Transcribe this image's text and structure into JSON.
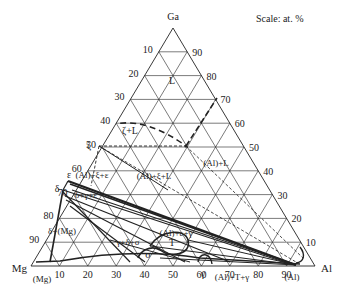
{
  "diagram": {
    "type": "ternary-phase-diagram",
    "vertices": {
      "top": {
        "label": "Ga",
        "x": 173,
        "y": 28
      },
      "left": {
        "label": "Mg",
        "x": 31,
        "y": 266
      },
      "right": {
        "label": "Al",
        "x": 315,
        "y": 266
      }
    },
    "scale_label": "Scale: at. %",
    "left_axis_ticks": [
      "10",
      "20",
      "30",
      "40",
      "50",
      "60",
      "70",
      "80",
      "90"
    ],
    "right_axis_ticks": [
      "90",
      "80",
      "70",
      "60",
      "50",
      "40",
      "30",
      "20",
      "10"
    ],
    "bottom_axis_ticks": [
      "10",
      "20",
      "30",
      "40",
      "50",
      "60",
      "70",
      "80",
      "90"
    ],
    "phase_labels": [
      {
        "text": "L",
        "x": 172,
        "y": 84
      },
      {
        "text": "ζ+L",
        "x": 130,
        "y": 134
      },
      {
        "text": "(Al)+L",
        "x": 216,
        "y": 166
      },
      {
        "text": "(Al)+ξ+ε",
        "x": 92,
        "y": 178
      },
      {
        "text": "(Al)+ξ+L",
        "x": 154,
        "y": 179
      },
      {
        "text": "δ+γ+ε",
        "x": 86,
        "y": 198
      },
      {
        "text": "(Al)+ε+γ",
        "x": 176,
        "y": 236
      },
      {
        "text": "δ+(Mg)",
        "x": 62,
        "y": 234
      },
      {
        "text": "γ+δ+σ",
        "x": 128,
        "y": 245
      },
      {
        "text": "T",
        "x": 172,
        "y": 246
      },
      {
        "text": "(Al)+T+γ",
        "x": 232,
        "y": 280
      },
      {
        "text": "γ",
        "x": 203,
        "y": 277
      },
      {
        "text": "(Al)",
        "x": 292,
        "y": 280
      },
      {
        "text": "(Mg)",
        "x": 42,
        "y": 282
      },
      {
        "text": "ζ",
        "x": 89,
        "y": 149
      },
      {
        "text": "ε",
        "x": 69,
        "y": 178
      },
      {
        "text": "δ",
        "x": 57,
        "y": 192
      },
      {
        "text": "σ",
        "x": 148,
        "y": 258
      }
    ],
    "special_points": {
      "zeta": {
        "label": "ζ",
        "x": 99,
        "y": 146
      },
      "peritectic": {
        "x": 186,
        "y": 146
      },
      "liquidus_top": {
        "x": 217,
        "y": 98
      }
    }
  }
}
